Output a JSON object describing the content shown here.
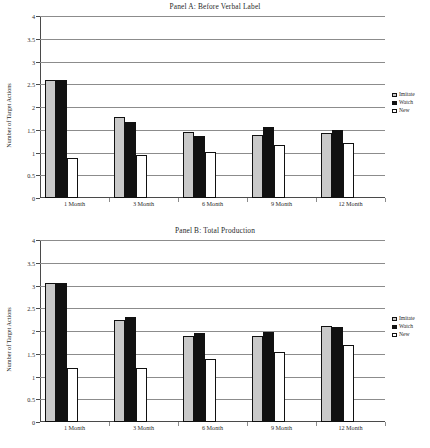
{
  "figure": {
    "panels": [
      {
        "title": "Panel A: Before Verbal Label",
        "ylabel": "Number of Target Actions",
        "legend": {
          "items": [
            "Imitate",
            "Watch",
            "New"
          ]
        }
      },
      {
        "title": "Panel B: Total Production",
        "ylabel": "Number of Target Actions",
        "legend": {
          "items": [
            "Imitate",
            "Watch",
            "New"
          ]
        }
      }
    ],
    "ytick_labels": [
      "4",
      "3.5",
      "3",
      "2.5",
      "2",
      "1.5",
      "1",
      "0.5",
      "0"
    ],
    "xtick_labels": [
      "1 Month",
      "3 Month",
      "6 Month",
      "9 Month",
      "12 Month"
    ]
  },
  "chart_data": [
    {
      "type": "bar",
      "title": "Panel A: Before Verbal Label",
      "xlabel": "",
      "ylabel": "Number of Target Actions",
      "ylim": [
        0,
        4
      ],
      "yticks": [
        0,
        0.5,
        1,
        1.5,
        2,
        2.5,
        3,
        3.5,
        4
      ],
      "grid": true,
      "legend_position": "right",
      "categories": [
        "1 Month",
        "3 Month",
        "6 Month",
        "9 Month",
        "12 Month"
      ],
      "series": [
        {
          "name": "Imitate",
          "color": "#c9c9c9",
          "values": [
            2.6,
            1.77,
            1.46,
            1.39,
            1.42
          ]
        },
        {
          "name": "Watch",
          "color": "#111111",
          "values": [
            2.6,
            1.66,
            1.37,
            1.56,
            1.49
          ]
        },
        {
          "name": "New",
          "color": "#ffffff",
          "values": [
            0.88,
            0.95,
            1.02,
            1.16,
            1.22
          ]
        }
      ]
    },
    {
      "type": "bar",
      "title": "Panel B: Total Production",
      "xlabel": "",
      "ylabel": "Number of Target Actions",
      "ylim": [
        0,
        4
      ],
      "yticks": [
        0,
        0.5,
        1,
        1.5,
        2,
        2.5,
        3,
        3.5,
        4
      ],
      "grid": true,
      "legend_position": "right",
      "categories": [
        "1 Month",
        "3 Month",
        "6 Month",
        "9 Month",
        "12 Month"
      ],
      "series": [
        {
          "name": "Imitate",
          "color": "#c9c9c9",
          "values": [
            3.05,
            2.25,
            1.9,
            1.88,
            2.12
          ]
        },
        {
          "name": "Watch",
          "color": "#111111",
          "values": [
            3.05,
            2.3,
            1.95,
            1.98,
            2.09
          ]
        },
        {
          "name": "New",
          "color": "#ffffff",
          "values": [
            1.19,
            1.19,
            1.38,
            1.54,
            1.7
          ]
        }
      ]
    }
  ]
}
